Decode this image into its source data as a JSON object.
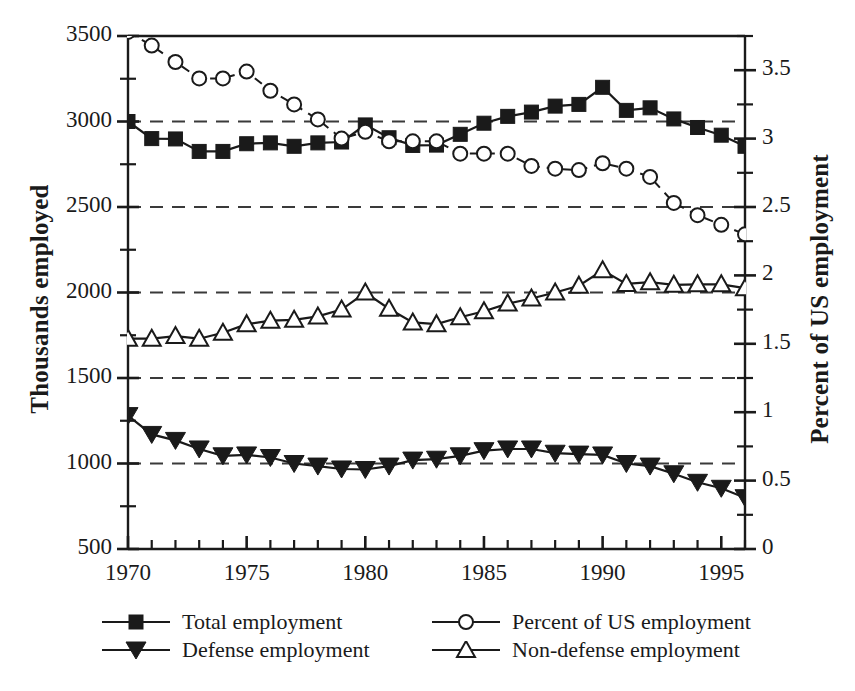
{
  "chart_data": {
    "type": "line",
    "title": "",
    "xlabel": "",
    "ylabel": "Thousands employed",
    "y2label": "Percent of US employment",
    "x": [
      1970,
      1971,
      1972,
      1973,
      1974,
      1975,
      1976,
      1977,
      1978,
      1979,
      1980,
      1981,
      1982,
      1983,
      1984,
      1985,
      1986,
      1987,
      1988,
      1989,
      1990,
      1991,
      1992,
      1993,
      1994,
      1995,
      1996
    ],
    "xlim": [
      1970,
      1996
    ],
    "ylim": [
      500,
      3500
    ],
    "y2lim": [
      0,
      3.75
    ],
    "xticks": [
      1970,
      1975,
      1980,
      1985,
      1990,
      1995
    ],
    "xtick_labels": [
      "1970",
      "1975",
      "1980",
      "1985",
      "1990",
      "1995"
    ],
    "yticks": [
      500,
      1000,
      1500,
      2000,
      2500,
      3000,
      3500
    ],
    "ytick_labels": [
      "500",
      "1000",
      "1500",
      "2000",
      "2500",
      "3000",
      "3500"
    ],
    "y2ticks": [
      0,
      0.5,
      1,
      1.5,
      2,
      2.5,
      3,
      3.5
    ],
    "y2tick_labels": [
      "0",
      "0.5",
      "1",
      "1.5",
      "2",
      "2.5",
      "3",
      "3.5"
    ],
    "grid": "horizontal-dashed",
    "legend_position": "below-plot",
    "series": [
      {
        "name": "Total employment",
        "axis": "left",
        "marker": "filled-square",
        "line": "solid",
        "values": [
          3000,
          2900,
          2898,
          2825,
          2825,
          2870,
          2875,
          2855,
          2875,
          2880,
          2980,
          2905,
          2860,
          2862,
          2925,
          2990,
          3030,
          3055,
          3090,
          3100,
          3200,
          3065,
          3080,
          3015,
          2965,
          2920,
          2855
        ]
      },
      {
        "name": "Defense employment",
        "axis": "left",
        "marker": "filled-triangle-down",
        "line": "solid",
        "values": [
          1280,
          1170,
          1135,
          1085,
          1045,
          1050,
          1035,
          1000,
          985,
          968,
          965,
          985,
          1020,
          1025,
          1045,
          1075,
          1085,
          1085,
          1060,
          1055,
          1050,
          1000,
          985,
          940,
          890,
          855,
          800
        ]
      },
      {
        "name": "Non-defense employment",
        "axis": "left",
        "marker": "open-triangle-up",
        "line": "solid",
        "values": [
          1730,
          1730,
          1745,
          1730,
          1765,
          1815,
          1835,
          1840,
          1860,
          1900,
          2000,
          1905,
          1825,
          1815,
          1855,
          1890,
          1935,
          1965,
          2000,
          2040,
          2130,
          2050,
          2060,
          2045,
          2048,
          2048,
          2025
        ]
      },
      {
        "name": "Percent of US employment",
        "axis": "right",
        "marker": "open-circle",
        "line": "dashed",
        "values": [
          3.78,
          3.68,
          3.56,
          3.44,
          3.44,
          3.49,
          3.35,
          3.25,
          3.14,
          3.0,
          3.05,
          2.98,
          2.98,
          2.98,
          2.89,
          2.89,
          2.89,
          2.8,
          2.78,
          2.77,
          2.82,
          2.78,
          2.72,
          2.53,
          2.44,
          2.37,
          2.3
        ]
      }
    ]
  },
  "legend": {
    "entries": [
      {
        "label": "Total employment",
        "marker": "filled-square"
      },
      {
        "label": "Percent of US employment",
        "marker": "open-circle"
      },
      {
        "label": "Defense employment",
        "marker": "filled-triangle-down"
      },
      {
        "label": "Non-defense employment",
        "marker": "open-triangle-up"
      }
    ]
  },
  "colors": {
    "ink": "#1a1a1a",
    "grid": "#3a3a3a",
    "background": "#ffffff"
  }
}
